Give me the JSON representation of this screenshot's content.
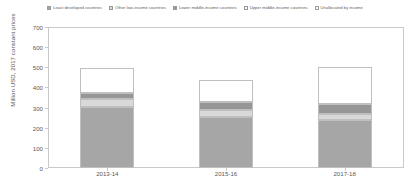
{
  "chart_data": {
    "type": "bar",
    "subtype": "stacked-column",
    "title": "",
    "xlabel": "",
    "ylabel": "Million USD, 2017 constant prices",
    "ylim": [
      0,
      700
    ],
    "yticks": [
      0,
      100,
      200,
      300,
      400,
      500,
      600,
      700
    ],
    "grid": false,
    "legend_position": "top",
    "categories": [
      "2013-14",
      "2015-16",
      "2017-18"
    ],
    "series": [
      {
        "name": "Least developed countries",
        "color": "#a6a6a6",
        "values": [
          303,
          254,
          240
        ]
      },
      {
        "name": "Other low-income countries",
        "color": "#d9d9d9",
        "values": [
          39,
          32,
          30
        ]
      },
      {
        "name": "Lower middle-income countries",
        "color": "#969696",
        "values": [
          29,
          42,
          49
        ]
      },
      {
        "name": "Upper middle-income countries",
        "color": "#f2f2f2",
        "values": [
          0,
          0,
          0
        ]
      },
      {
        "name": "Unallocated by income",
        "color": "#ffffff",
        "values": [
          127,
          110,
          183
        ]
      }
    ],
    "totals": [
      497,
      438,
      502
    ]
  },
  "legend": {
    "items": [
      {
        "label": "Least developed countries",
        "color": "#a6a6a6"
      },
      {
        "label": "Other low-income countries",
        "color": "#d9d9d9"
      },
      {
        "label": "Lower middle-income countries",
        "color": "#969696"
      },
      {
        "label": "Upper middle-income countries",
        "color": "#f2f2f2"
      },
      {
        "label": "Unallocated by income",
        "color": "#ffffff"
      }
    ]
  },
  "axes": {
    "y_title": "Million USD, 2017 constant prices",
    "y_labels": [
      "700",
      "600",
      "500",
      "400",
      "300",
      "200",
      "100",
      "0"
    ],
    "x_labels": [
      "2013-14",
      "2015-16",
      "2017-18"
    ]
  }
}
